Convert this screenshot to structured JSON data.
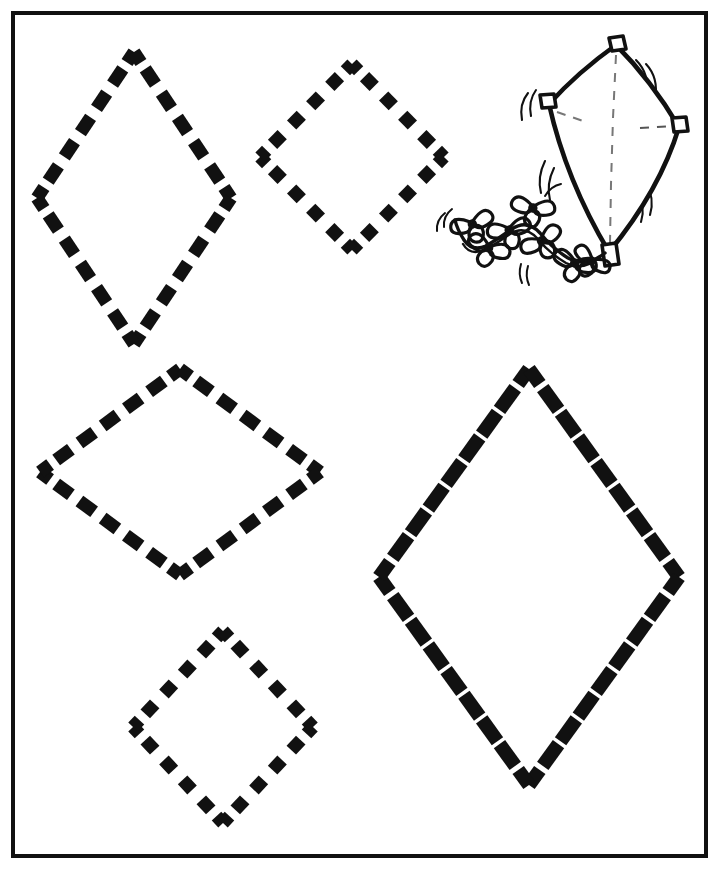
{
  "page": {
    "background_color": "#ffffff",
    "ink_color": "#111111",
    "width": 720,
    "height": 870
  },
  "border": {
    "name": "page-border",
    "x": 13,
    "y": 13,
    "width": 693,
    "height": 843,
    "stroke_width": 4,
    "color": "#111111"
  },
  "illustration": {
    "name": "kite-illustration",
    "label": "kite-with-bow-tail",
    "color": "#111111",
    "kite": {
      "top": [
        616,
        42
      ],
      "left": [
        547,
        102
      ],
      "right": [
        681,
        125
      ],
      "bottom": [
        610,
        255
      ],
      "spar_color": "#111111",
      "dashed_spar_color": "#555555"
    },
    "corner_tabs": 4,
    "motion_lines": 6,
    "tail": {
      "bows": 7,
      "start": [
        606,
        252
      ],
      "end": [
        455,
        222
      ]
    }
  },
  "shapes": [
    {
      "id": "rhombus-1",
      "name": "dashed-rhombus-tall-narrow",
      "description": "tall narrow vertical rhombus",
      "center": [
        134,
        198
      ],
      "half_width": 97,
      "half_height": 146,
      "dashes_per_side": 5,
      "stroke_width": 13,
      "color": "#111111"
    },
    {
      "id": "rhombus-2",
      "name": "dashed-rhombus-upper-right",
      "description": "near-square diamond, upper middle",
      "center": [
        352,
        157
      ],
      "half_width": 92,
      "half_height": 93,
      "dashes_per_side": 4,
      "stroke_width": 13,
      "color": "#111111"
    },
    {
      "id": "rhombus-3",
      "name": "dashed-rhombus-wide-middle-left",
      "description": "wide flat rhombus, middle left",
      "center": [
        180,
        472
      ],
      "half_width": 140,
      "half_height": 103,
      "dashes_per_side": 5,
      "stroke_width": 13,
      "color": "#111111"
    },
    {
      "id": "rhombus-4",
      "name": "dashed-rhombus-small-bottom-left",
      "description": "small diamond, bottom left",
      "center": [
        223,
        727
      ],
      "half_width": 90,
      "half_height": 96,
      "dashes_per_side": 4,
      "stroke_width": 13,
      "color": "#111111"
    },
    {
      "id": "rhombus-5",
      "name": "dashed-rhombus-large-bottom-right",
      "description": "large rhombus, bottom right",
      "center": [
        529,
        577
      ],
      "half_width": 150,
      "half_height": 208,
      "dashes_per_side": 7,
      "stroke_width": 14,
      "color": "#111111"
    }
  ]
}
